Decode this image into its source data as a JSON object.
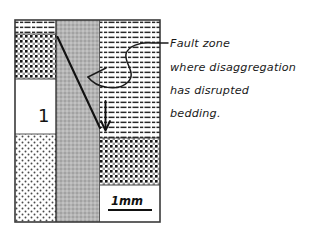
{
  "figure": {
    "title_visible": false,
    "background_color": "#ffffff",
    "ink_color": "#1a1a1a"
  },
  "annotation": {
    "lines": [
      "Fault zone",
      "where  disaggregation",
      "has disrupted",
      "bedding."
    ],
    "leader": "s-curve-leader-line"
  },
  "scale_bar": {
    "label": "1mm"
  },
  "specimen_box": {
    "bed_label": "1",
    "outline_color": "#333333",
    "columns": [
      {
        "name": "left-block",
        "layers": [
          {
            "pattern": "dashes",
            "fill": "#ffffff"
          },
          {
            "pattern": "coarse-dots",
            "fill": "#ffffff"
          },
          {
            "pattern": "blank",
            "fill": "#ffffff"
          },
          {
            "pattern": "fine-stipple",
            "fill": "#ffffff"
          }
        ]
      },
      {
        "name": "fault-zone-band",
        "layers": [
          {
            "pattern": "uniform-gray",
            "fill": "#b0b0b0"
          }
        ]
      },
      {
        "name": "right-block",
        "layers": [
          {
            "pattern": "dashes",
            "fill": "#ffffff"
          },
          {
            "pattern": "coarse-dots",
            "fill": "#ffffff"
          },
          {
            "pattern": "blank",
            "fill": "#ffffff"
          }
        ]
      }
    ],
    "fault_trace": "diagonal-fault-line",
    "displacement_arrow": "down-arrow"
  }
}
